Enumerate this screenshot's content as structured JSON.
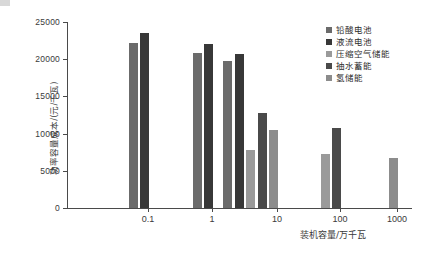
{
  "chart_data": {
    "type": "bar",
    "title": "",
    "xlabel": "装机容量/万千瓦",
    "ylabel": "功率容量成本/(元/千瓦)",
    "categories": [
      "0.1",
      "1",
      "10",
      "100",
      "1000"
    ],
    "ylim": [
      0,
      25000
    ],
    "yticks": [
      "0",
      "5000",
      "10000",
      "15000",
      "20000",
      "25000"
    ],
    "ytick_values": [
      0,
      5000,
      10000,
      15000,
      20000,
      25000
    ],
    "grid": false,
    "legend_position": "top-right",
    "series": [
      {
        "name": "铅酸电池",
        "color": "#6b6b6b",
        "values": [
          22200,
          20900,
          19800,
          null,
          null
        ]
      },
      {
        "name": "液流电池",
        "color": "#383838",
        "values": [
          23500,
          22000,
          20700,
          null,
          null
        ]
      },
      {
        "name": "压缩空气储能",
        "color": "#9a9a9a",
        "values": [
          null,
          null,
          7800,
          7200,
          null
        ]
      },
      {
        "name": "抽水蓄能",
        "color": "#4a4a4a",
        "values": [
          null,
          null,
          12800,
          10800,
          null
        ]
      },
      {
        "name": "氢储能",
        "color": "#8c8c8c",
        "values": [
          null,
          null,
          10500,
          null,
          6700
        ]
      }
    ]
  },
  "axis": {
    "y_title": "功率容量成本/(元/千瓦)",
    "x_title": "装机容量/万千瓦"
  },
  "colors": {
    "axis": "#4a4a4a",
    "text": "#3a3a3a",
    "background": "#ffffff"
  }
}
